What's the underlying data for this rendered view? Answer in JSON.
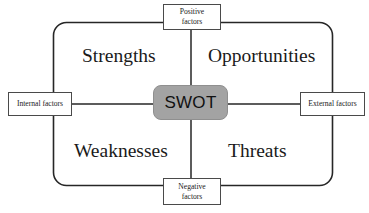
{
  "diagram": {
    "center": {
      "label": "SWOT",
      "fill_color": "#a3a3a3",
      "text_color": "#111111"
    },
    "axis_boxes": {
      "top": {
        "line1": "Positive",
        "line2": "factors",
        "full": "Positive factors"
      },
      "bottom": {
        "line1": "Negative",
        "line2": "factors",
        "full": "Negative factors"
      },
      "left": {
        "line1": "Internal factors",
        "full": "Internal factors"
      },
      "right": {
        "line1": "External factors",
        "full": "External factors"
      }
    },
    "quadrants": [
      {
        "key": "strengths",
        "label": "Strengths",
        "position": "top-left"
      },
      {
        "key": "opportunities",
        "label": "Opportunities",
        "position": "top-right"
      },
      {
        "key": "weaknesses",
        "label": "Weaknesses",
        "position": "bottom-left"
      },
      {
        "key": "threats",
        "label": "Threats",
        "position": "bottom-right"
      }
    ],
    "colors": {
      "stroke": "#262626",
      "box_border": "#4a4a4a",
      "background": "#ffffff",
      "text": "#1a1a1a"
    }
  }
}
